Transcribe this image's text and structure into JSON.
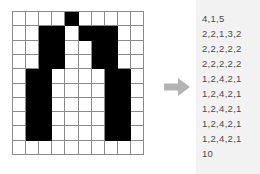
{
  "figure": {
    "grid": {
      "name": "bitmap-grid",
      "columns": 10,
      "rows": 10,
      "on_color": "#000000",
      "off_color": "#ffffff",
      "line_color": "#8a8a8a",
      "cells": [
        [
          0,
          0,
          0,
          0,
          1,
          0,
          0,
          0,
          0,
          0
        ],
        [
          0,
          0,
          1,
          1,
          0,
          1,
          1,
          1,
          0,
          0
        ],
        [
          0,
          0,
          1,
          1,
          0,
          0,
          1,
          1,
          0,
          0
        ],
        [
          0,
          0,
          1,
          1,
          0,
          0,
          1,
          1,
          0,
          0
        ],
        [
          0,
          1,
          1,
          0,
          0,
          0,
          0,
          1,
          1,
          0
        ],
        [
          0,
          1,
          1,
          0,
          0,
          0,
          0,
          1,
          1,
          0
        ],
        [
          0,
          1,
          1,
          0,
          0,
          0,
          0,
          1,
          1,
          0
        ],
        [
          0,
          1,
          1,
          0,
          0,
          0,
          0,
          1,
          1,
          0
        ],
        [
          0,
          1,
          1,
          0,
          0,
          0,
          0,
          1,
          1,
          0
        ],
        [
          0,
          0,
          0,
          0,
          0,
          0,
          0,
          0,
          0,
          0
        ]
      ]
    },
    "arrow": {
      "name": "right-arrow-icon",
      "direction": "right",
      "color": "#b3b3b3"
    },
    "encoding": {
      "name": "encoding-list",
      "background": "#f2f2f2",
      "text_color": "#4a4a4a",
      "lines": [
        "4,1,5",
        "2,2,1,3,2",
        "2,2,2,2,2",
        "2,2,2,2,2",
        "1,2,4,2,1",
        "1,2,4,2,1",
        "1,2,4,2,1",
        "1,2,4,2,1",
        "1,2,4,2,1",
        "10"
      ]
    }
  },
  "chart_data": {
    "type": "heatmap",
    "xlabel": "",
    "ylabel": "",
    "categories": [
      "c0",
      "c1",
      "c2",
      "c3",
      "c4",
      "c5",
      "c6",
      "c7",
      "c8",
      "c9"
    ],
    "series": [
      {
        "name": "row 1",
        "values": [
          0,
          0,
          0,
          0,
          1,
          0,
          0,
          0,
          0,
          0
        ],
        "encoding": "4,1,5"
      },
      {
        "name": "row 2",
        "values": [
          0,
          0,
          1,
          1,
          0,
          1,
          1,
          1,
          0,
          0
        ],
        "encoding": "2,2,1,3,2"
      },
      {
        "name": "row 3",
        "values": [
          0,
          0,
          1,
          1,
          0,
          0,
          1,
          1,
          0,
          0
        ],
        "encoding": "2,2,2,2,2"
      },
      {
        "name": "row 4",
        "values": [
          0,
          0,
          1,
          1,
          0,
          0,
          1,
          1,
          0,
          0
        ],
        "encoding": "2,2,2,2,2"
      },
      {
        "name": "row 5",
        "values": [
          0,
          1,
          1,
          0,
          0,
          0,
          0,
          1,
          1,
          0
        ],
        "encoding": "1,2,4,2,1"
      },
      {
        "name": "row 6",
        "values": [
          0,
          1,
          1,
          0,
          0,
          0,
          0,
          1,
          1,
          0
        ],
        "encoding": "1,2,4,2,1"
      },
      {
        "name": "row 7",
        "values": [
          0,
          1,
          1,
          0,
          0,
          0,
          0,
          1,
          1,
          0
        ],
        "encoding": "1,2,4,2,1"
      },
      {
        "name": "row 8",
        "values": [
          0,
          1,
          1,
          0,
          0,
          0,
          0,
          1,
          1,
          0
        ],
        "encoding": "1,2,4,2,1"
      },
      {
        "name": "row 9",
        "values": [
          0,
          1,
          1,
          0,
          0,
          0,
          0,
          1,
          1,
          0
        ],
        "encoding": "1,2,4,2,1"
      },
      {
        "name": "row 10",
        "values": [
          0,
          0,
          0,
          0,
          0,
          0,
          0,
          0,
          0,
          0
        ],
        "encoding": "10"
      }
    ],
    "legend": [],
    "grid": true
  }
}
